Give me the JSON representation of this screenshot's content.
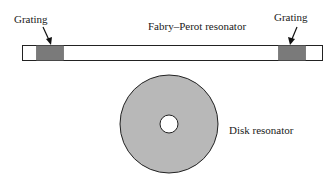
{
  "diagram": {
    "fabry_perot": {
      "label": "Fabry–Perot resonator",
      "grating_left_label": "Grating",
      "grating_right_label": "Grating"
    },
    "disk": {
      "label": "Disk resonator"
    },
    "colors": {
      "grating_fill": "#7a7a7a",
      "disk_fill": "#b8b8b8",
      "stroke": "#222222"
    }
  }
}
